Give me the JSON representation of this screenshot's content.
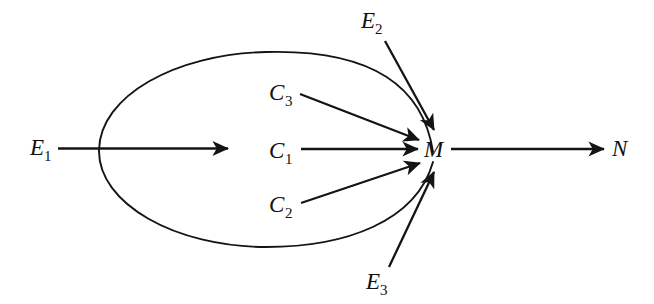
{
  "figure": {
    "background_color": "#ffffff",
    "stroke_color": "#141414",
    "width": 654,
    "height": 304
  },
  "nodes": {
    "e1": {
      "label": "E",
      "subscript": "1",
      "full": "E1",
      "x": 30,
      "y": 155
    },
    "e2": {
      "label": "E",
      "subscript": "2",
      "full": "E2",
      "x": 361,
      "y": 28
    },
    "e3": {
      "label": "E",
      "subscript": "3",
      "full": "E3",
      "x": 366,
      "y": 289
    },
    "c1": {
      "label": "C",
      "subscript": "1",
      "full": "C1",
      "x": 270,
      "y": 158
    },
    "c2": {
      "label": "C",
      "subscript": "2",
      "full": "C2",
      "x": 270,
      "y": 212
    },
    "c3": {
      "label": "C",
      "subscript": "3",
      "full": "C3",
      "x": 270,
      "y": 100
    },
    "m": {
      "label": "M",
      "subscript": "",
      "full": "M",
      "x": 424,
      "y": 157
    },
    "n": {
      "label": "N",
      "subscript": "",
      "full": "N",
      "x": 612,
      "y": 156
    }
  },
  "edges": [
    {
      "name": "e1-to-midpoint",
      "from": "E1",
      "to": "(arrow into ellipse)",
      "style": "straight",
      "arrowhead": true
    },
    {
      "name": "c1-to-m",
      "from": "C1",
      "to": "M",
      "style": "straight",
      "arrowhead": true
    },
    {
      "name": "c3-to-m",
      "from": "C3",
      "to": "M",
      "style": "straight",
      "arrowhead": true
    },
    {
      "name": "c2-to-m",
      "from": "C2",
      "to": "M",
      "style": "straight",
      "arrowhead": true
    },
    {
      "name": "e2-to-m",
      "from": "E2",
      "to": "M",
      "style": "straight",
      "arrowhead": true
    },
    {
      "name": "e3-to-m",
      "from": "E3",
      "to": "M",
      "style": "straight",
      "arrowhead": true
    },
    {
      "name": "m-to-n",
      "from": "M",
      "to": "N",
      "style": "straight",
      "arrowhead": true
    },
    {
      "name": "ellipse-boundary",
      "from": "E1 region",
      "to": "M",
      "style": "ellipse",
      "arrowhead": false
    }
  ],
  "ellipse": {
    "name": "enclosing-ellipse",
    "left_x": 99,
    "right_x": 434,
    "top_y": 52,
    "bottom_y": 248,
    "center_x": 266,
    "center_y": 150
  }
}
